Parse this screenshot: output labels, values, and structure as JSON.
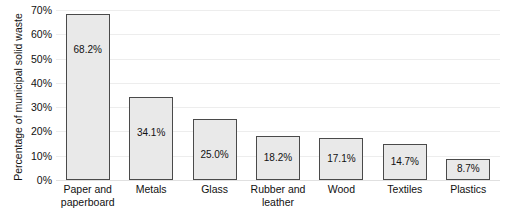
{
  "chart_data": {
    "type": "bar",
    "title": "",
    "xlabel": "",
    "ylabel": "Percentage of municipal solid waste",
    "ylim": [
      0,
      70
    ],
    "ytick_labels": [
      "70%",
      "60%",
      "50%",
      "40%",
      "30%",
      "20%",
      "10%",
      "0%"
    ],
    "ytick_values": [
      70,
      60,
      50,
      40,
      30,
      20,
      10,
      0
    ],
    "grid": true,
    "legend": "none",
    "categories": [
      "Paper and paperboard",
      "Metals",
      "Glass",
      "Rubber and leather",
      "Wood",
      "Textiles",
      "Plastics"
    ],
    "category_lines": [
      [
        "Paper and",
        "paperboard"
      ],
      [
        "Metals"
      ],
      [
        "Glass"
      ],
      [
        "Rubber and",
        "leather"
      ],
      [
        "Wood"
      ],
      [
        "Textiles"
      ],
      [
        "Plastics"
      ]
    ],
    "values": [
      68.2,
      34.1,
      25.0,
      18.2,
      17.1,
      14.7,
      8.7
    ],
    "data_labels": [
      "68.2%",
      "34.1%",
      "25.0%",
      "18.2%",
      "17.1%",
      "14.7%",
      "8.7%"
    ],
    "colors": {
      "bar_fill": "#e9e9e9",
      "bar_border": "#4a4a4a",
      "gridline": "#ededed",
      "text": "#111111",
      "background": "#ffffff"
    }
  }
}
